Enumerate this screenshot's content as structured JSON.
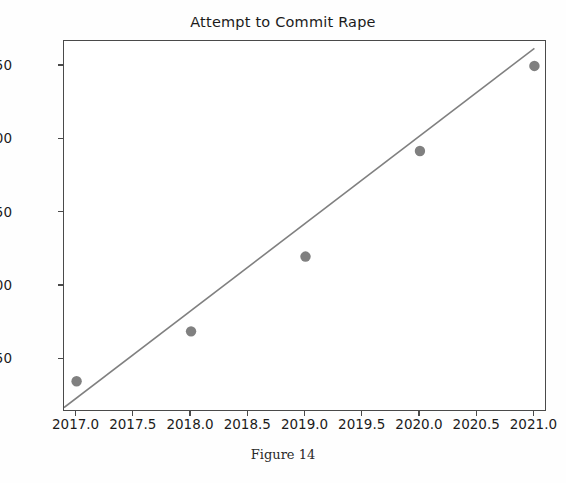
{
  "chart_data": {
    "type": "scatter",
    "title": "Attempt to Commit Rape",
    "caption": "Figure 14",
    "xlabel": "",
    "ylabel": "",
    "x": [
      2017,
      2018,
      2019,
      2020,
      2021
    ],
    "values": [
      235,
      269,
      320,
      392,
      450
    ],
    "series": [
      {
        "name": "Attempt to Commit Rape",
        "type": "scatter",
        "x": [
          2017,
          2018,
          2019,
          2020,
          2021
        ],
        "values": [
          235,
          269,
          320,
          392,
          450
        ],
        "marker_color": "#808080"
      },
      {
        "name": "Trend line",
        "type": "line",
        "x": [
          2016.89,
          2021.0
        ],
        "values": [
          217,
          462
        ],
        "line_color": "#808080"
      }
    ],
    "xlim": [
      2016.89,
      2021.11
    ],
    "ylim": [
      214,
      467
    ],
    "xticks": [
      2017.0,
      2017.5,
      2018.0,
      2018.5,
      2019.0,
      2019.5,
      2020.0,
      2020.5,
      2021.0
    ],
    "xtick_labels": [
      "2017.0",
      "2017.5",
      "2018.0",
      "2018.5",
      "2019.0",
      "2019.5",
      "2020.0",
      "2020.5",
      "2021.0"
    ],
    "yticks": [
      250,
      300,
      350,
      400,
      450
    ],
    "ytick_labels": [
      "250",
      "300",
      "350",
      "400",
      "450"
    ],
    "grid": false,
    "legend": "none",
    "colors": {
      "marker": "#808080",
      "trend_line": "#808080",
      "axis": "#4a4a4a",
      "text": "#1b1b1b",
      "background": "#ffffff"
    }
  }
}
